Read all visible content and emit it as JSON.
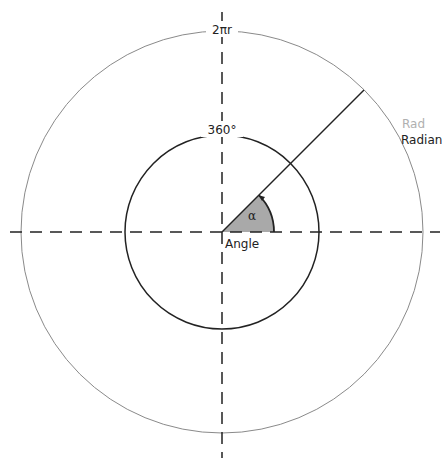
{
  "diagram": {
    "labels": {
      "outer_circumference": "2πr",
      "inner_full_angle": "360°",
      "rad_short": "Rad",
      "radian": "Radian",
      "alpha": "α",
      "angle": "Angle"
    },
    "colors": {
      "outer_circle": "#8a8a8a",
      "inner_circle": "#222222",
      "axes": "#222222",
      "radius_line": "#222222",
      "angle_fill": "#a9a9a9",
      "rad_label": "#b0b0b0",
      "text": "#222222"
    },
    "geometry": {
      "center": [
        222,
        232
      ],
      "inner_radius": 97,
      "outer_radius": 201,
      "radius_angle_deg": 45,
      "angle_sector_radius": 52
    }
  }
}
